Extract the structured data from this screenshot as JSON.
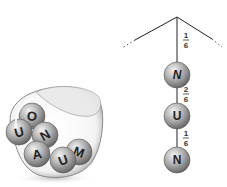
{
  "jar": {
    "balls": [
      {
        "letter": "O",
        "cx": 32,
        "cy": 116,
        "rotate": 10
      },
      {
        "letter": "U",
        "cx": 19,
        "cy": 132,
        "rotate": -15
      },
      {
        "letter": "N",
        "cx": 45,
        "cy": 135,
        "rotate": -30
      },
      {
        "letter": "M",
        "cx": 79,
        "cy": 152,
        "rotate": 20
      },
      {
        "letter": "A",
        "cx": 37,
        "cy": 154,
        "rotate": -10
      },
      {
        "letter": "U",
        "cx": 63,
        "cy": 160,
        "rotate": -20
      }
    ]
  },
  "tree": {
    "nodes": [
      {
        "letter": "N",
        "cx": 177,
        "cy": 75,
        "italic": true
      },
      {
        "letter": "U",
        "cx": 177,
        "cy": 116,
        "italic": false
      },
      {
        "letter": "N",
        "cx": 177,
        "cy": 160,
        "italic": false
      }
    ],
    "branches": [
      {
        "num": "1",
        "den": "6"
      },
      {
        "num": "2",
        "den": "6"
      },
      {
        "num": "1",
        "den": "6"
      }
    ]
  }
}
